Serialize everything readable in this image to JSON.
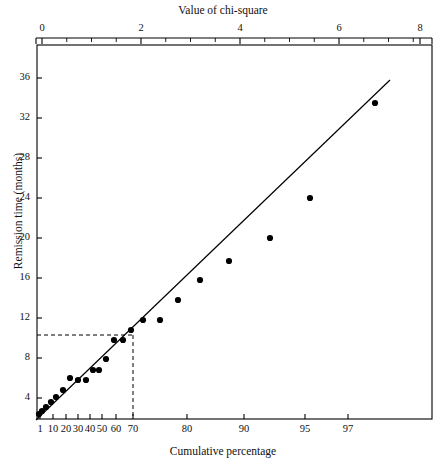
{
  "figure": {
    "top_axis_title": "Value of chi-square",
    "bottom_axis_title": "Cumulative percentage",
    "y_axis_title": "Remission time (months)"
  },
  "chart_data": {
    "type": "scatter",
    "title": "",
    "subtitle": "",
    "xlabel": "Cumulative percentage",
    "ylabel": "Remission time (months)",
    "secondary_xlabel": "Value of chi-square",
    "grid": false,
    "legend": "none",
    "plot_style": "normal-probability-plot",
    "x_axis_bottom": {
      "label": "Cumulative percentage",
      "scale": "probability",
      "tick_labels": [
        "1",
        "10",
        "20",
        "30",
        "40",
        "50",
        "60",
        "70",
        "80",
        "90",
        "95",
        "97"
      ],
      "tick_values": [
        1,
        10,
        20,
        30,
        40,
        50,
        60,
        70,
        80,
        90,
        95,
        97
      ],
      "tick_px": [
        40,
        53,
        66,
        78,
        90,
        102,
        116,
        133,
        187,
        244,
        305,
        348
      ],
      "xlim_px": [
        37,
        432
      ]
    },
    "x_axis_top": {
      "label": "Value of chi-square",
      "scale": "linear",
      "tick_labels": [
        "0",
        "2",
        "4",
        "6",
        "8"
      ],
      "tick_values": [
        0,
        2,
        4,
        6,
        8
      ],
      "tick_px": [
        42,
        141,
        240,
        339,
        420
      ],
      "minor_tick_count_between": 3,
      "xlim": [
        0,
        8.5
      ]
    },
    "y_axis": {
      "label": "Remission time (months)",
      "tick_labels": [
        "4",
        "8",
        "12",
        "16",
        "20",
        "24",
        "28",
        "32",
        "36"
      ],
      "tick_values": [
        4,
        8,
        12,
        16,
        20,
        24,
        28,
        32,
        36
      ],
      "tick_px": [
        398,
        358,
        318,
        278,
        238,
        198,
        158,
        118,
        78
      ],
      "ylim": [
        0,
        38.5
      ]
    },
    "points": [
      {
        "cum_pct": 1.5,
        "remission_months": 0.6,
        "px": [
          39,
          414
        ]
      },
      {
        "cum_pct": 3.5,
        "remission_months": 0.9,
        "px": [
          42,
          411
        ]
      },
      {
        "cum_pct": 6,
        "remission_months": 1.3,
        "px": [
          46,
          407
        ]
      },
      {
        "cum_pct": 9,
        "remission_months": 1.8,
        "px": [
          51,
          402
        ]
      },
      {
        "cum_pct": 13,
        "remission_months": 2.3,
        "px": [
          56,
          397
        ]
      },
      {
        "cum_pct": 18,
        "remission_months": 3.0,
        "px": [
          63,
          390
        ]
      },
      {
        "cum_pct": 24,
        "remission_months": 4.2,
        "px": [
          70,
          378
        ]
      },
      {
        "cum_pct": 30,
        "remission_months": 4.0,
        "px": [
          78,
          380
        ]
      },
      {
        "cum_pct": 36,
        "remission_months": 4.0,
        "px": [
          86,
          380
        ]
      },
      {
        "cum_pct": 41,
        "remission_months": 5.0,
        "px": [
          93,
          370
        ]
      },
      {
        "cum_pct": 46,
        "remission_months": 5.0,
        "px": [
          99,
          370
        ]
      },
      {
        "cum_pct": 52,
        "remission_months": 6.1,
        "px": [
          106,
          359
        ]
      },
      {
        "cum_pct": 57,
        "remission_months": 8.0,
        "px": [
          114,
          340
        ]
      },
      {
        "cum_pct": 61,
        "remission_months": 8.0,
        "px": [
          123,
          340
        ]
      },
      {
        "cum_pct": 64,
        "remission_months": 9.0,
        "px": [
          131,
          330
        ]
      },
      {
        "cum_pct": 67,
        "remission_months": 10.0,
        "px": [
          143,
          320
        ]
      },
      {
        "cum_pct": 71,
        "remission_months": 10.0,
        "px": [
          160,
          320
        ]
      },
      {
        "cum_pct": 76,
        "remission_months": 12.0,
        "px": [
          178,
          300
        ]
      },
      {
        "cum_pct": 80,
        "remission_months": 14.0,
        "px": [
          200,
          280
        ]
      },
      {
        "cum_pct": 84,
        "remission_months": 16.0,
        "px": [
          229,
          261
        ]
      },
      {
        "cum_pct": 88,
        "remission_months": 20.0,
        "px": [
          270,
          238
        ]
      },
      {
        "cum_pct": 92,
        "remission_months": 24.0,
        "px": [
          310,
          198
        ]
      },
      {
        "cum_pct": 98,
        "remission_months": 34.5,
        "px": [
          375,
          103
        ]
      }
    ],
    "fit_line": {
      "px_start": [
        36,
        420
      ],
      "px_end": [
        390,
        80
      ]
    },
    "reference_lines": [
      {
        "orientation": "horizontal",
        "remission_months": 9.5,
        "style": "dashed",
        "px_y": 335,
        "px_x_from": 37,
        "px_x_to": 133
      },
      {
        "orientation": "vertical",
        "cum_pct": 64,
        "style": "dashed",
        "px_x": 133,
        "px_y_from": 335,
        "px_y_to": 419
      }
    ]
  },
  "colors": {
    "axis": "#000000",
    "marker": "#000000",
    "line": "#000000",
    "dashed": "#000000",
    "background": "#ffffff"
  }
}
